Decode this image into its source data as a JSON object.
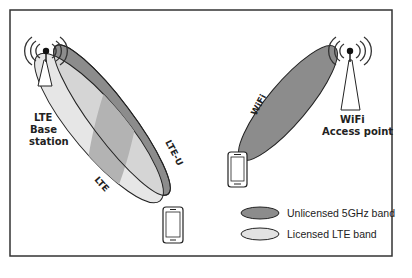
{
  "diagram": {
    "lte_base_station": {
      "line1": "LTE",
      "line2": "Base",
      "line3": "station"
    },
    "wifi_access_point": {
      "line1": "WiFi",
      "line2": "Access point"
    },
    "beams": {
      "lte_u": {
        "label": "LTE-U"
      },
      "lte": {
        "label": "LTE"
      },
      "wifi": {
        "label": "WiFi"
      }
    },
    "legend": [
      {
        "label": "Unlicensed 5GHz band",
        "color": "#8c8c8c"
      },
      {
        "label": "Licensed LTE band",
        "color": "#e2e2e2"
      }
    ],
    "colors": {
      "unlicensed": "#8c8c8c",
      "licensed": "#e2e2e2",
      "overlap": "#b3b3b3",
      "border": "#222222"
    }
  }
}
